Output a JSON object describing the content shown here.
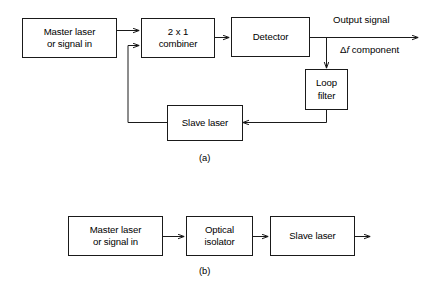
{
  "figure": {
    "background_color": "#ffffff",
    "line_color": "#1a1a1a",
    "text_color": "#000000"
  },
  "panel_a": {
    "caption": "(a)",
    "blocks": {
      "master_laser": {
        "line1": "Master laser",
        "line2": "or signal in"
      },
      "combiner": {
        "line1": "2 x 1",
        "line2": "combiner"
      },
      "detector": {
        "line1": "Detector"
      },
      "loop_filter": {
        "line1": "Loop",
        "line2": "filter"
      },
      "slave_laser": {
        "line1": "Slave laser"
      }
    },
    "labels": {
      "output_signal": "Output signal",
      "delta_f_prefix": "Δ",
      "delta_f_italic": "f",
      "delta_f_suffix": " component"
    }
  },
  "panel_b": {
    "caption": "(b)",
    "blocks": {
      "master_laser": {
        "line1": "Master laser",
        "line2": "or signal in"
      },
      "optical_isolator": {
        "line1": "Optical",
        "line2": "isolator"
      },
      "slave_laser": {
        "line1": "Slave laser"
      }
    }
  }
}
